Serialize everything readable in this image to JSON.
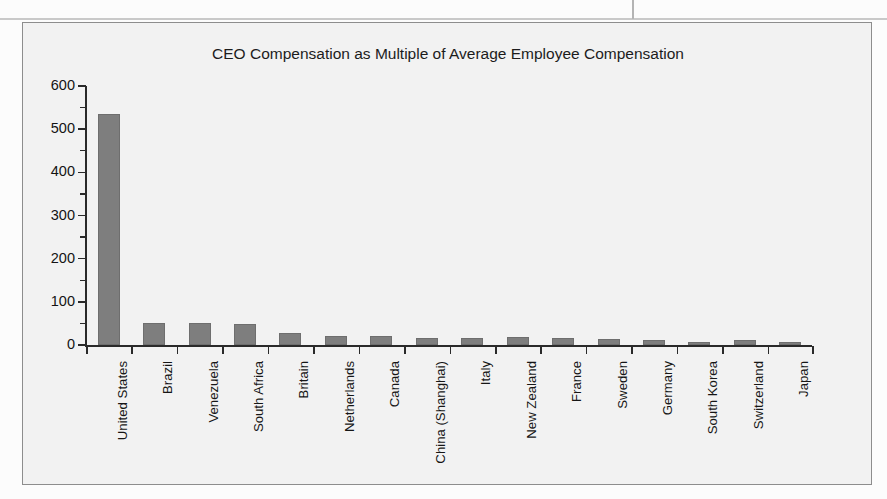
{
  "page": {
    "background_color": "#fcfcfc",
    "rule_color": "#c9c9c9"
  },
  "chart_frame": {
    "border_color": "#8d8d8d",
    "fill_color": "#f2f2f2"
  },
  "chart_data": {
    "type": "bar",
    "title": "CEO Compensation as Multiple of Average Employee Compensation",
    "xlabel": "",
    "ylabel": "",
    "ylim": [
      0,
      600
    ],
    "yticks": [
      0,
      100,
      200,
      300,
      400,
      500,
      600
    ],
    "ytick_labels": [
      "0",
      "100",
      "200",
      "300",
      "400",
      "500",
      "600"
    ],
    "minor_tick_step": 50,
    "grid": false,
    "legend": false,
    "bar_color": "#7e7e7e",
    "categories": [
      "United States",
      "Brazil",
      "Venezuela",
      "South Africa",
      "Britain",
      "Netherlands",
      "Canada",
      "China (Shanghai)",
      "Italy",
      "New Zealand",
      "France",
      "Sweden",
      "Germany",
      "South Korea",
      "Switzerland",
      "Japan"
    ],
    "values": [
      535,
      51,
      50,
      49,
      28,
      22,
      22,
      17,
      17,
      18,
      17,
      15,
      12,
      8,
      11,
      7
    ]
  }
}
